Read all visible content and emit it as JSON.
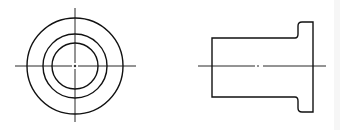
{
  "drawing": {
    "title": "Flanged bushing — two orthographic views",
    "line_color": "#111111",
    "views": {
      "end_view": {
        "label": "End view",
        "center": [
          75,
          66
        ],
        "circles": [
          {
            "name": "outer-flange-circle",
            "r": 48
          },
          {
            "name": "body-outer-circle",
            "r": 32
          },
          {
            "name": "bore-circle",
            "r": 23
          }
        ],
        "centerline_h": [
          15,
          136
        ],
        "centerline_v": [
          8,
          122
        ]
      },
      "side_view": {
        "label": "Side view",
        "body": {
          "x": 212,
          "y": 38,
          "w": 86,
          "h": 59
        },
        "flange": {
          "x": 298,
          "y": 22,
          "w": 15,
          "h": 90,
          "corner_r": 4
        },
        "centerline": {
          "y": 66,
          "x1": 198,
          "x2": 326
        }
      }
    }
  }
}
